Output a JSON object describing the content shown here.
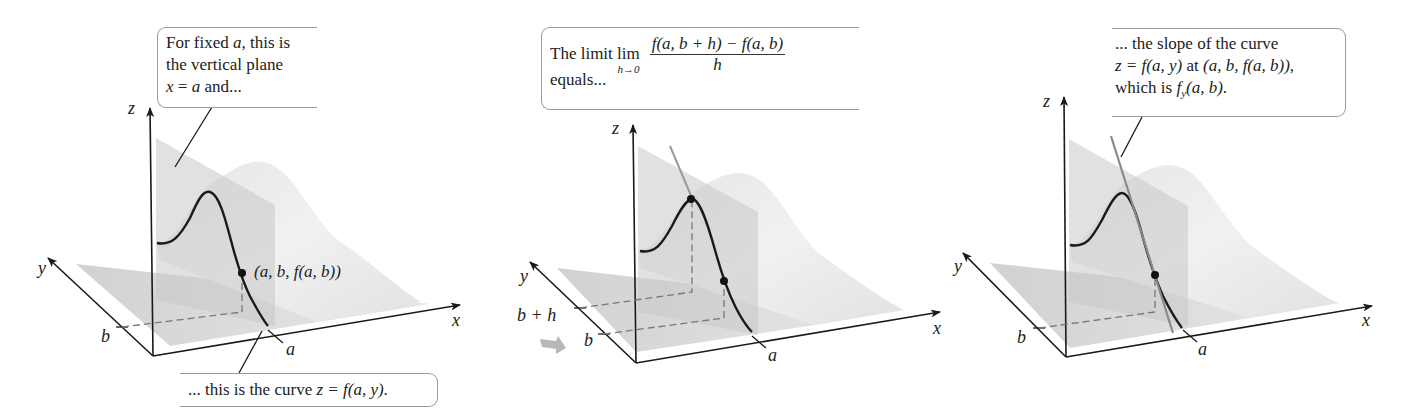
{
  "figure": {
    "colors": {
      "surface_light": "#ececec",
      "surface_mid": "#dadada",
      "plane": "#d0d0d0",
      "curve": "#1a1a1a",
      "tangent": "#8a8a8a",
      "axis": "#1a1a1a",
      "callout_border": "#9a9a9a",
      "arrow_gray": "#b8b8b8"
    }
  },
  "panels": [
    {
      "id": "panel-1",
      "axis_labels": {
        "x": "x",
        "y": "y",
        "z": "z"
      },
      "tick_labels": {
        "a": "a",
        "b": "b"
      },
      "point_label": "(a, b, f(a, b))",
      "callout_top": {
        "line1_pre": "For fixed ",
        "line1_var": "a",
        "line1_post": ", this is",
        "line2": "the vertical plane",
        "line3_var1": "x",
        "line3_eq": " = ",
        "line3_var2": "a",
        "line3_post": " and..."
      },
      "callout_bottom": {
        "pre": "... this is the curve ",
        "formula": "z = f(a, y)",
        "post": "."
      }
    },
    {
      "id": "panel-2",
      "axis_labels": {
        "x": "x",
        "y": "y",
        "z": "z"
      },
      "tick_labels": {
        "a": "a",
        "b": "b",
        "b_plus_h": "b + h"
      },
      "callout": {
        "pre": "The limit ",
        "lim": "lim",
        "lim_sub": "h→0",
        "numerator": "f(a, b + h) − f(a, b)",
        "denominator": "h",
        "line2": "equals..."
      }
    },
    {
      "id": "panel-3",
      "axis_labels": {
        "x": "x",
        "y": "y",
        "z": "z"
      },
      "tick_labels": {
        "a": "a",
        "b": "b"
      },
      "callout": {
        "line1": "... the slope of the curve",
        "line2_formula": "z = f(a, y)",
        "line2_mid": " at ",
        "line2_point": "(a, b, f(a, b))",
        "line2_post": ",",
        "line3_pre": "which is ",
        "line3_f": "f",
        "line3_sub": "y",
        "line3_args": "(a, b)",
        "line3_post": "."
      }
    }
  ]
}
